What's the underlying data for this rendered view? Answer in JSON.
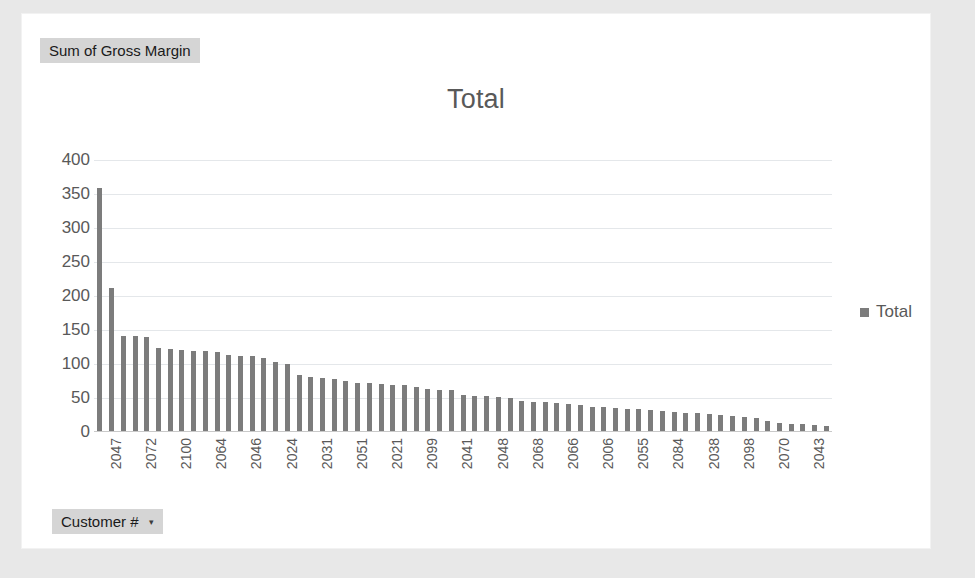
{
  "card": {
    "value_field_label": "Sum of Gross Margin",
    "axis_field_label": "Customer #",
    "axis_field_caret": "▾"
  },
  "chart_data": {
    "type": "bar",
    "title": "Total",
    "xlabel": "Customer #",
    "ylabel": "Sum of Gross Margin",
    "ylim": [
      0,
      400
    ],
    "ytick_values": [
      400,
      350,
      300,
      250,
      200,
      150,
      100,
      50,
      0
    ],
    "ytick_labels": [
      "400",
      "350",
      "300",
      "250",
      "200",
      "150",
      "100",
      "50",
      "0"
    ],
    "grid": true,
    "legend": [
      "Total"
    ],
    "legend_position": "right",
    "series_color": "#7c7c7c",
    "label_interval": 3,
    "categories": [
      "2047",
      "",
      "",
      "2072",
      "",
      "",
      "2100",
      "",
      "",
      "2064",
      "",
      "",
      "2046",
      "",
      "",
      "2024",
      "",
      "",
      "2031",
      "",
      "",
      "2051",
      "",
      "",
      "2021",
      "",
      "",
      "2099",
      "",
      "",
      "2041",
      "",
      "",
      "2048",
      "",
      "",
      "2068",
      "",
      "",
      "2066",
      "",
      "",
      "2006",
      "",
      "",
      "2055",
      "",
      "",
      "2084",
      "",
      "",
      "2038",
      "",
      "",
      "2098",
      "",
      "",
      "2070",
      "",
      "",
      "2043",
      "",
      ""
    ],
    "values": [
      357,
      211,
      140,
      139,
      138,
      122,
      120,
      119,
      118,
      117,
      116,
      112,
      111,
      110,
      108,
      101,
      99,
      83,
      80,
      78,
      76,
      73,
      71,
      70,
      69,
      68,
      67,
      64,
      62,
      61,
      60,
      53,
      52,
      51,
      50,
      49,
      44,
      43,
      42,
      41,
      40,
      38,
      36,
      35,
      34,
      33,
      32,
      31,
      30,
      28,
      27,
      26,
      25,
      24,
      22,
      21,
      19,
      14,
      12,
      11,
      10,
      9,
      8
    ],
    "series": [
      {
        "name": "Total",
        "values": [
          357,
          211,
          140,
          139,
          138,
          122,
          120,
          119,
          118,
          117,
          116,
          112,
          111,
          110,
          108,
          101,
          99,
          83,
          80,
          78,
          76,
          73,
          71,
          70,
          69,
          68,
          67,
          64,
          62,
          61,
          60,
          53,
          52,
          51,
          50,
          49,
          44,
          43,
          42,
          41,
          40,
          38,
          36,
          35,
          34,
          33,
          32,
          31,
          30,
          28,
          27,
          26,
          25,
          24,
          22,
          21,
          19,
          14,
          12,
          11,
          10,
          9,
          8
        ]
      }
    ]
  }
}
